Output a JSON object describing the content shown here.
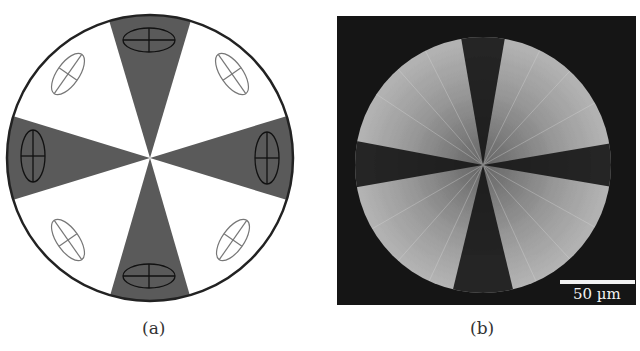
{
  "figure": {
    "panels": [
      {
        "id": "a",
        "caption": "(a)",
        "type": "schematic",
        "description": "Circular spherulite schematic with four dark Maltese-cross sectors (top, bottom, left, right) and four white sectors containing tilted index ellipses",
        "colors": {
          "dark_sector": "#5a5a5a",
          "light_sector": "#ffffff",
          "outline": "#222222",
          "ellipse_light": "#777777",
          "ellipse_dark": "#111111"
        }
      },
      {
        "id": "b",
        "caption": "(b)",
        "type": "micrograph",
        "description": "Polarized optical micrograph of a spherulite showing Maltese cross extinction pattern",
        "scale_bar": {
          "label": "50 µm"
        },
        "colors": {
          "background": "#151515",
          "scale_bar": "#f2f2f2"
        }
      }
    ]
  }
}
